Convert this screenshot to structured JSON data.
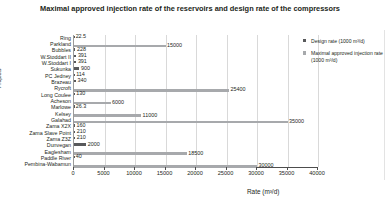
{
  "chart_data": {
    "type": "bar",
    "orientation": "horizontal",
    "title": "Maximal approved injection rate of the reservoirs and design rate of the compressors",
    "xlabel": "Rate (m³/d)",
    "ylabel": "Projects",
    "xlim": [
      0,
      40000
    ],
    "xticks": [
      0,
      5000,
      10000,
      15000,
      20000,
      25000,
      30000,
      35000,
      40000
    ],
    "grid": true,
    "legend_position": "right",
    "categories": [
      "Ring",
      "Parkland",
      "Bubbles",
      "W.Stoddart II",
      "W.Stoddart I",
      "Sukunka",
      "PC Jedney",
      "Brazeau",
      "Rycroft",
      "Long Coulee",
      "Acheson",
      "Marlowe",
      "Kelsey",
      "Galahad",
      "Zama X2X",
      "Zama Slave Point",
      "Zama Z3Z",
      "Dunvegan",
      "Eaglesham",
      "Paddle River",
      "Pembina-Wabamun"
    ],
    "series": [
      {
        "name": "Design rate (1000 m³/d)",
        "color": "#58595b",
        "values": [
          22.5,
          null,
          228,
          391,
          391,
          900,
          114,
          340,
          null,
          130,
          null,
          26.3,
          null,
          null,
          160,
          210,
          210,
          2000,
          null,
          40,
          null
        ],
        "labels": [
          "22.5",
          "",
          "228",
          "391",
          "391",
          "900",
          "114",
          "340",
          "",
          "130",
          "",
          "26.3",
          "",
          "",
          "160",
          "210",
          "210",
          "2000",
          "",
          "40",
          ""
        ]
      },
      {
        "name": "Maximal approved injection rate (1000 m³/d)",
        "color": "#a7a9ac",
        "values": [
          null,
          15000,
          null,
          null,
          null,
          null,
          null,
          null,
          25400,
          null,
          6000,
          null,
          11000,
          35000,
          null,
          null,
          null,
          null,
          18500,
          null,
          30000
        ],
        "labels": [
          "",
          "15000",
          "",
          "",
          "",
          "",
          "",
          "",
          "25400",
          "",
          "6000",
          "",
          "11000",
          "35000",
          "",
          "",
          "",
          "",
          "18500",
          "",
          "30000"
        ]
      }
    ]
  },
  "legend": {
    "items": [
      {
        "label": "Design rate (1000 m³/d)",
        "color": "#58595b"
      },
      {
        "label": "Maximal approved injection rate (1000 m³/d)",
        "color": "#a7a9ac"
      }
    ]
  }
}
